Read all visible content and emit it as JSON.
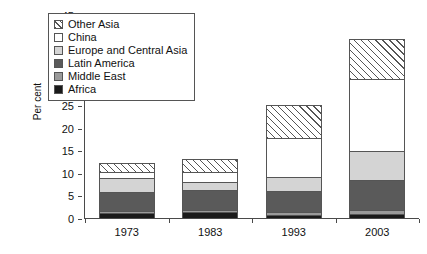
{
  "chart_data": {
    "type": "bar",
    "title": "",
    "subtitle": "",
    "xlabel": "",
    "ylabel": "Per cent",
    "categories": [
      "1973",
      "1983",
      "1993",
      "2003"
    ],
    "ylim": [
      0,
      45
    ],
    "yticks": [
      0,
      5,
      10,
      15,
      20,
      25,
      30,
      35,
      40,
      45
    ],
    "grid": false,
    "stacked": true,
    "legend_position": "top-left",
    "stack_order_bottom_up": [
      "Africa",
      "Middle East",
      "Latin America",
      "Europe and Central Asia",
      "China",
      "Other Asia"
    ],
    "series": [
      {
        "name": "Other Asia",
        "fill": "diagonal-hatch",
        "values": [
          2.0,
          2.7,
          7.2,
          8.8
        ]
      },
      {
        "name": "China",
        "fill": "white",
        "values": [
          1.5,
          2.2,
          8.6,
          16.0
        ]
      },
      {
        "name": "Europe and Central Asia",
        "fill": "light-gray",
        "values": [
          3.0,
          1.9,
          3.1,
          6.4
        ]
      },
      {
        "name": "Latin America",
        "fill": "dark-gray",
        "values": [
          4.2,
          4.3,
          4.7,
          6.6
        ]
      },
      {
        "name": "Middle East",
        "fill": "medium-gray",
        "values": [
          0.5,
          0.6,
          0.7,
          0.9
        ]
      },
      {
        "name": "Africa",
        "fill": "black",
        "values": [
          1.3,
          1.5,
          0.9,
          1.1
        ]
      }
    ],
    "totals": [
      12.5,
      13.2,
      25.2,
      39.8
    ]
  },
  "legend": {
    "items": [
      {
        "label": "Other Asia"
      },
      {
        "label": "China"
      },
      {
        "label": "Europe and Central Asia"
      },
      {
        "label": "Latin America"
      },
      {
        "label": "Middle East"
      },
      {
        "label": "Africa"
      }
    ]
  }
}
